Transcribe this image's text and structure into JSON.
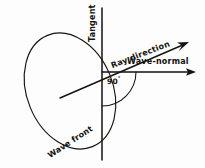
{
  "figure": {
    "kind": "optics-ray-diagram",
    "background_color": "#fdfdfd",
    "ink_color": "#15120f",
    "width": 205,
    "height": 168
  },
  "labels": {
    "tangent": "Tangent",
    "ray_direction": "Ray direction",
    "wave_normal": "Wave-normal",
    "wave_front": "Wave front",
    "right_angle": "90",
    "degree_sign": "°"
  },
  "geometry": {
    "origin": {
      "x": 102,
      "y": 72
    },
    "wave_front_ellipse": {
      "center_x": 70,
      "center_y": 91,
      "radius_x": 43,
      "radius_y": 60,
      "rotation_deg": -22
    },
    "tangent_line": {
      "x": 102,
      "y1": 8,
      "y2": 160
    },
    "wave_normal_arrow": {
      "x1": 102,
      "y1": 72,
      "x2": 196,
      "y2": 72
    },
    "ray_direction_arrow": {
      "x1": 60,
      "y1": 98,
      "x2": 189,
      "y2": 42
    },
    "right_angle_arc": {
      "radius": 34,
      "start_deg": 0,
      "end_deg": 90
    }
  }
}
